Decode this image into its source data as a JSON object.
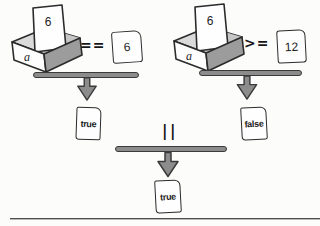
{
  "left_comparison": {
    "box_label": "a",
    "box_paper_value": "6",
    "operator": "==",
    "operand_value": "6",
    "result_value": "true"
  },
  "right_comparison": {
    "box_label": "a",
    "box_paper_value": "6",
    "operator": ">=",
    "operand_value": "12",
    "result_value": "false"
  },
  "combination": {
    "operator": "||",
    "result_value": "true"
  },
  "colors": {
    "bar_fill": "#8c8c8c",
    "bar_stroke": "#3a3a3a",
    "box_side": "#9c9c9c",
    "box_interior": "#dadada",
    "paper": "#fefefe",
    "ink": "#2b2b2b",
    "background": "#fcfcfb"
  }
}
